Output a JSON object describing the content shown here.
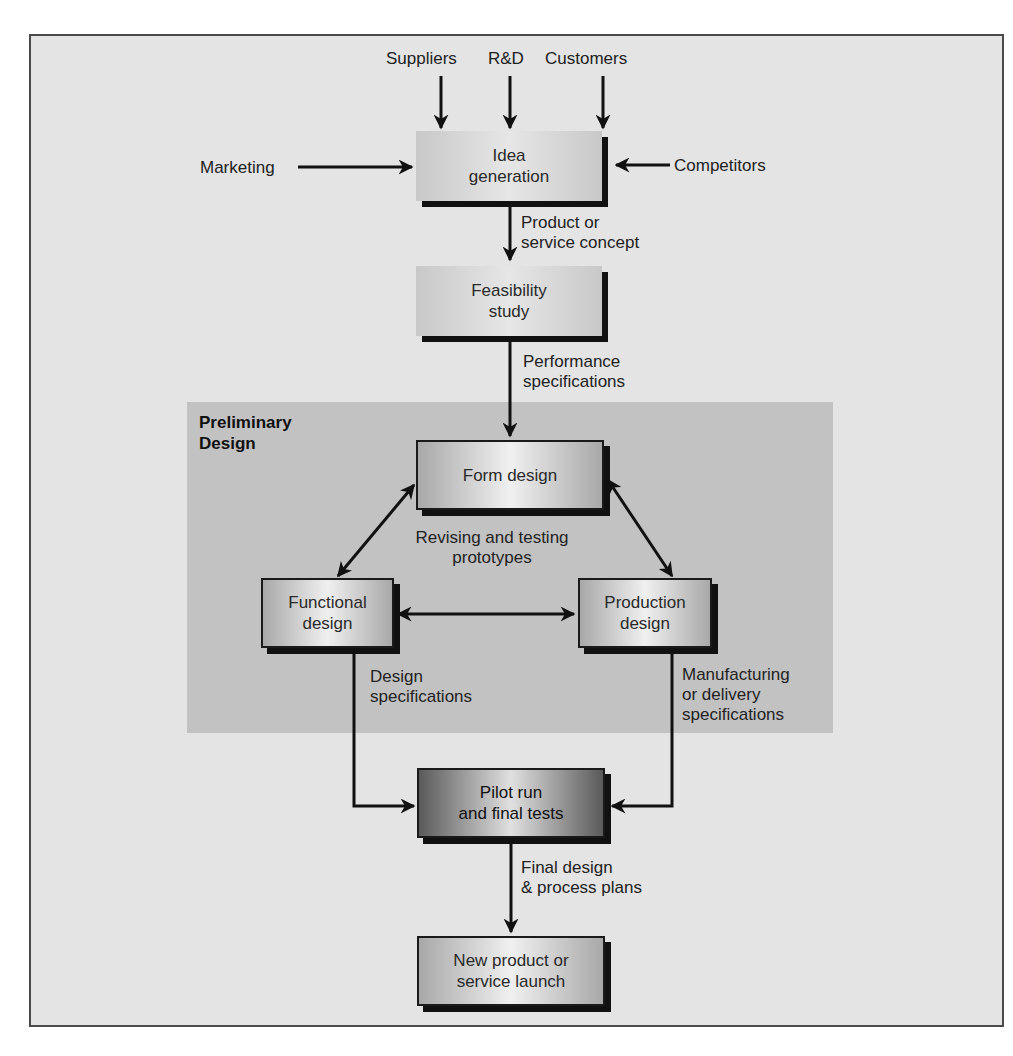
{
  "diagram": {
    "type": "flowchart",
    "preliminary_group": {
      "label_line1": "Preliminary",
      "label_line2": "Design"
    },
    "inputs": {
      "suppliers": "Suppliers",
      "rnd": "R&D",
      "customers": "Customers",
      "marketing": "Marketing",
      "competitors": "Competitors"
    },
    "nodes": {
      "idea": {
        "line1": "Idea",
        "line2": "generation"
      },
      "feasibility": {
        "line1": "Feasibility",
        "line2": "study"
      },
      "form": {
        "line1": "Form design"
      },
      "functional": {
        "line1": "Functional",
        "line2": "design"
      },
      "production": {
        "line1": "Production",
        "line2": "design"
      },
      "pilot": {
        "line1": "Pilot run",
        "line2": "and final tests"
      },
      "launch": {
        "line1": "New product or",
        "line2": "service launch"
      }
    },
    "edge_labels": {
      "concept": {
        "line1": "Product or",
        "line2": "service concept"
      },
      "performance": {
        "line1": "Performance",
        "line2": "specifications"
      },
      "prototypes": {
        "line1": "Revising and testing",
        "line2": "prototypes"
      },
      "design_specs": {
        "line1": "Design",
        "line2": "specifications"
      },
      "manufacturing_specs": {
        "line1": "Manufacturing",
        "line2": "or delivery",
        "line3": "specifications"
      },
      "final": {
        "line1": "Final design",
        "line2": "& process plans"
      }
    },
    "edges": [
      {
        "from": "Suppliers",
        "to": "Idea generation"
      },
      {
        "from": "R&D",
        "to": "Idea generation"
      },
      {
        "from": "Customers",
        "to": "Idea generation"
      },
      {
        "from": "Marketing",
        "to": "Idea generation"
      },
      {
        "from": "Competitors",
        "to": "Idea generation"
      },
      {
        "from": "Idea generation",
        "to": "Feasibility study",
        "label": "Product or service concept"
      },
      {
        "from": "Feasibility study",
        "to": "Form design",
        "label": "Performance specifications"
      },
      {
        "from": "Form design",
        "to": "Functional design",
        "bidirectional": true
      },
      {
        "from": "Form design",
        "to": "Production design",
        "bidirectional": true
      },
      {
        "from": "Functional design",
        "to": "Production design",
        "bidirectional": true
      },
      {
        "from": "Functional design",
        "to": "Pilot run and final tests",
        "label": "Design specifications"
      },
      {
        "from": "Production design",
        "to": "Pilot run and final tests",
        "label": "Manufacturing or delivery specifications"
      },
      {
        "from": "Pilot run and final tests",
        "to": "New product or service launch",
        "label": "Final design & process plans"
      }
    ]
  }
}
